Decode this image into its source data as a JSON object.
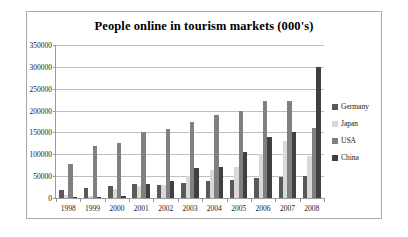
{
  "chart_data": {
    "type": "bar",
    "title": "People online in tourism markets (000's)",
    "xlabel": "",
    "ylabel": "",
    "ylim": [
      0,
      350000
    ],
    "ytick_step": 50000,
    "yticks": [
      "350000",
      "300000",
      "250000",
      "200000",
      "150000",
      "100000",
      "50000",
      "0"
    ],
    "grid": true,
    "legend_position": "right",
    "categories": [
      "1998",
      "1999",
      "2000",
      "2001",
      "2002",
      "2003",
      "2004",
      "2005",
      "2006",
      "2007",
      "2008"
    ],
    "series": [
      {
        "name": "Germany",
        "color": "#595959",
        "values": [
          18000,
          22000,
          28000,
          32000,
          30000,
          35000,
          40000,
          42000,
          45000,
          48000,
          50000
        ]
      },
      {
        "name": "Japan",
        "color": "#d9d9d9",
        "values": [
          8000,
          5000,
          20000,
          28000,
          30000,
          50000,
          65000,
          72000,
          100000,
          130000,
          95000
        ]
      },
      {
        "name": "USA",
        "color": "#808080",
        "values": [
          78000,
          118000,
          125000,
          150000,
          158000,
          175000,
          190000,
          200000,
          222000,
          222000,
          160000
        ]
      },
      {
        "name": "China",
        "color": "#404040",
        "values": [
          2000,
          3000,
          4000,
          32000,
          38000,
          68000,
          70000,
          105000,
          140000,
          150000,
          300000
        ]
      }
    ]
  },
  "legend": {
    "items": [
      {
        "label": "Germany"
      },
      {
        "label": "Japan"
      },
      {
        "label": "USA"
      },
      {
        "label": "China"
      }
    ]
  }
}
